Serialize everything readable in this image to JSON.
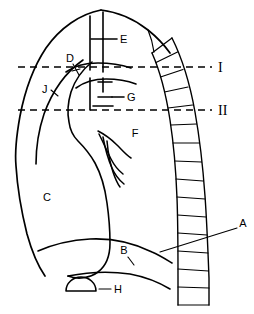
{
  "figure": {
    "background_color": "#ffffff",
    "line_color": "#000000",
    "width": 254,
    "height": 314
  },
  "labels": {
    "a": "A",
    "b": "B",
    "c": "C",
    "d": "D",
    "e": "E",
    "f": "F",
    "g": "G",
    "h": "H",
    "j": "J"
  },
  "levels": {
    "one": "I",
    "two": "II"
  },
  "icons": {
    "lung_field": "lung-outline-icon",
    "spine": "vertebral-column-icon",
    "diaphragm": "diaphragm-curve-icon",
    "trachea": "trachea-icon",
    "aortic_arch": "aortic-arch-icon",
    "vessels": "pulmonary-vessels-icon",
    "gastric_bubble": "gastric-bubble-icon",
    "level_marker_one": "level-line-i-icon",
    "level_marker_two": "level-line-ii-icon"
  }
}
